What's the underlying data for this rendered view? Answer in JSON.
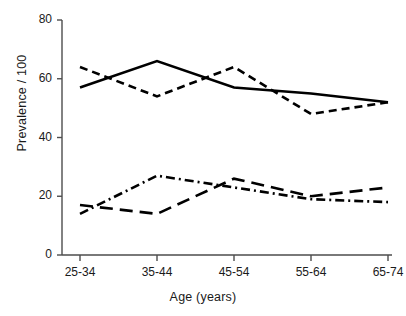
{
  "chart_data": {
    "type": "line",
    "title": "",
    "xlabel": "Age (years)",
    "ylabel": "Prevalence / 100",
    "categories": [
      "25-34",
      "35-44",
      "45-54",
      "55-64",
      "65-74"
    ],
    "ylim": [
      0,
      80
    ],
    "yticks": [
      0,
      20,
      40,
      60,
      80
    ],
    "grid": false,
    "legend": "none",
    "series": [
      {
        "name": "solid",
        "style": "solid",
        "values": [
          57,
          66,
          57,
          55,
          52
        ]
      },
      {
        "name": "dashed",
        "style": "dashed",
        "values": [
          64,
          54,
          64,
          48,
          52
        ]
      },
      {
        "name": "long-dash",
        "style": "long-dashed",
        "values": [
          17,
          14,
          26,
          20,
          23
        ]
      },
      {
        "name": "dash-dot",
        "style": "dash-dot",
        "values": [
          14,
          27,
          23,
          19,
          18
        ]
      }
    ]
  },
  "axes": {
    "y_tick_labels": [
      "80",
      "60",
      "40",
      "20",
      "0"
    ],
    "x_tick_labels": [
      "25-34",
      "35-44",
      "45-54",
      "55-64",
      "65-74"
    ],
    "x_axis_title": "Age (years)",
    "y_axis_title": "Prevalence / 100"
  },
  "colors": {
    "line": "#000000",
    "axis": "#4d4d4d",
    "text": "#1a1a1a",
    "background": "#ffffff"
  }
}
